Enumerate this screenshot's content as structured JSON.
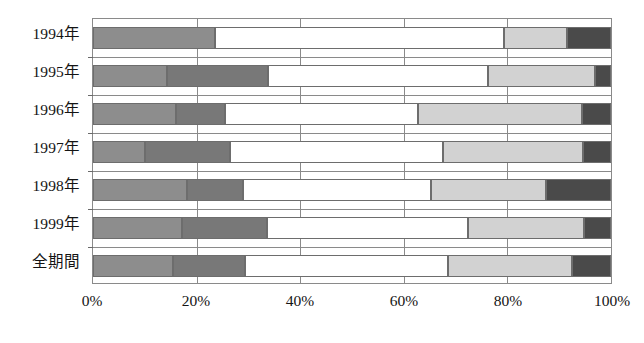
{
  "chart_data": {
    "type": "bar",
    "orientation": "horizontal",
    "stacked": true,
    "normalized": true,
    "title": "",
    "subtitle": "",
    "xlabel": "",
    "ylabel": "",
    "xlim": [
      0,
      100
    ],
    "xticks": [
      0,
      20,
      40,
      60,
      80,
      100
    ],
    "xticklabels": [
      "0%",
      "20%",
      "40%",
      "60%",
      "80%",
      "100%"
    ],
    "grid": "vertical",
    "legend": "none",
    "categories": [
      "1994年",
      "1995年",
      "1996年",
      "1997年",
      "1998年",
      "1999年",
      "全期間"
    ],
    "series": [
      {
        "name": "series-1",
        "color": "#8d8d8d",
        "values": [
          23.5,
          14.2,
          16.0,
          10.0,
          18.1,
          17.1,
          15.4
        ]
      },
      {
        "name": "series-2",
        "color": "#787878",
        "values": [
          0.0,
          19.5,
          9.4,
          16.5,
          10.9,
          16.5,
          14.0
        ]
      },
      {
        "name": "series-3",
        "color": "#ffffff",
        "values": [
          55.9,
          42.5,
          37.3,
          41.0,
          36.2,
          38.7,
          39.1
        ]
      },
      {
        "name": "series-4",
        "color": "#d2d2d2",
        "values": [
          12.1,
          20.8,
          31.7,
          27.1,
          22.3,
          22.5,
          24.0
        ]
      },
      {
        "name": "series-5",
        "color": "#4a4a4a",
        "values": [
          8.5,
          3.0,
          5.6,
          5.4,
          12.5,
          5.2,
          7.5
        ]
      }
    ]
  },
  "axis": {
    "x_tick_labels": [
      "0%",
      "20%",
      "40%",
      "60%",
      "80%",
      "100%"
    ]
  },
  "categories": [
    "1994年",
    "1995年",
    "1996年",
    "1997年",
    "1998年",
    "1999年",
    "全期間"
  ]
}
